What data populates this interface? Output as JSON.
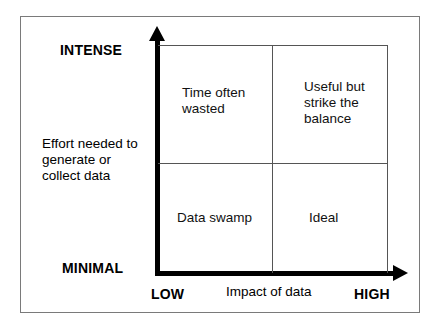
{
  "figure": {
    "background_color": "#ffffff",
    "frame_color": "#7a7a7a",
    "axis_color": "#000000",
    "grid_color": "#555555"
  },
  "axes": {
    "y": {
      "title": "Effort needed to\ngenerate or\ncollect data",
      "title_line_1": "Effort needed to",
      "title_line_2": "generate or",
      "title_line_3": "collect data",
      "high_label": "INTENSE",
      "low_label": "MINIMAL",
      "arrow_direction": "up"
    },
    "x": {
      "title": "Impact of data",
      "low_label": "LOW",
      "high_label": "HIGH",
      "arrow_direction": "right"
    }
  },
  "chart_data": {
    "type": "table",
    "subtype": "2x2-quadrant-matrix",
    "title": "",
    "xlabel": "Impact of data",
    "ylabel": "Effort needed to generate or collect data",
    "x_categories": [
      "LOW",
      "HIGH"
    ],
    "y_categories": [
      "MINIMAL",
      "INTENSE"
    ],
    "grid": true,
    "legend": "none",
    "quadrants": [
      {
        "id": "top-left",
        "x": "LOW",
        "y": "INTENSE",
        "label": "Time often wasted",
        "lines": [
          "Time often",
          "wasted"
        ]
      },
      {
        "id": "top-right",
        "x": "HIGH",
        "y": "INTENSE",
        "label": "Useful but strike the balance",
        "lines": [
          "Useful but",
          "strike the",
          "balance"
        ]
      },
      {
        "id": "bottom-left",
        "x": "LOW",
        "y": "MINIMAL",
        "label": "Data swamp",
        "lines": [
          "Data swamp"
        ]
      },
      {
        "id": "bottom-right",
        "x": "HIGH",
        "y": "MINIMAL",
        "label": "Ideal",
        "lines": [
          "Ideal"
        ]
      }
    ]
  }
}
